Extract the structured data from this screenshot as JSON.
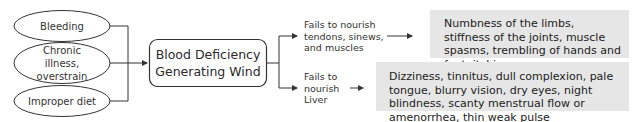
{
  "causes": [
    {
      "label": "Bleeding"
    },
    {
      "label": "Chronic illness, overstrain"
    },
    {
      "label": "Improper diet"
    }
  ],
  "central": {
    "label": "Blood Deficiency Generating Wind"
  },
  "branches": [
    {
      "mechanism": "Fails to nourish tendons, sinews, and muscles",
      "symptoms": "Numbness of the limbs, stiffness of the joints, muscle spasms, trembling of hands and feet, itching"
    },
    {
      "mechanism": "Fails to nourish Liver",
      "symptoms": "Dizziness, tinnitus, dull complexion, pale tongue, blurry vision, dry eyes, night blindness, scanty menstrual flow or amenorrhea, thin weak pulse"
    }
  ],
  "colors": {
    "line": "#333333",
    "symptom_box": "#e6e6e6",
    "background": "#ffffff"
  }
}
